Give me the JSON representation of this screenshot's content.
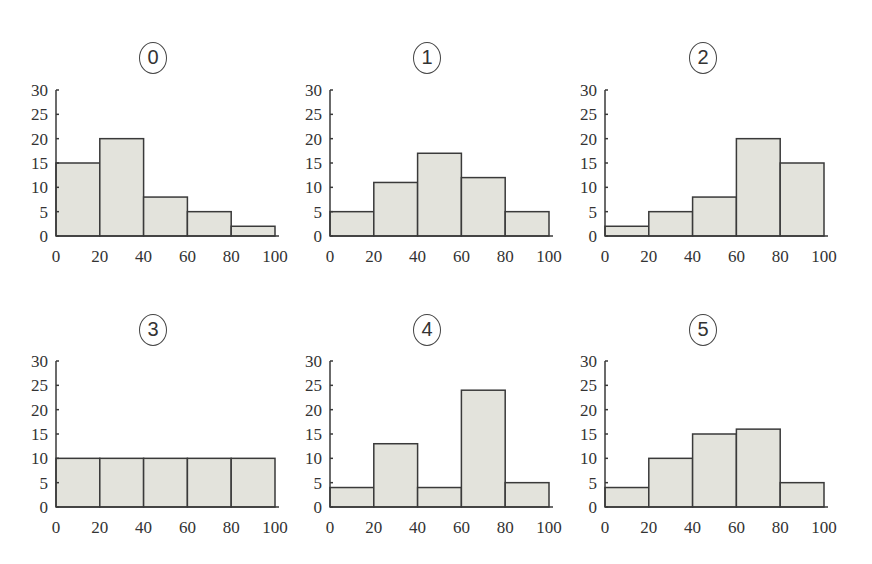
{
  "chart_data": [
    {
      "type": "bar",
      "title": "⓪",
      "label": "0",
      "categories": [
        "0-20",
        "20-40",
        "40-60",
        "60-80",
        "80-100"
      ],
      "bin_edges": [
        0,
        20,
        40,
        60,
        80,
        100
      ],
      "values": [
        15,
        20,
        8,
        5,
        2
      ],
      "xlabel": "",
      "ylabel": "",
      "xticks": [
        0,
        20,
        40,
        60,
        80,
        100
      ],
      "yticks": [
        0,
        5,
        10,
        15,
        20,
        25,
        30
      ],
      "ylim": [
        0,
        30
      ],
      "grid": false
    },
    {
      "type": "bar",
      "title": "①",
      "label": "1",
      "categories": [
        "0-20",
        "20-40",
        "40-60",
        "60-80",
        "80-100"
      ],
      "bin_edges": [
        0,
        20,
        40,
        60,
        80,
        100
      ],
      "values": [
        5,
        11,
        17,
        12,
        5
      ],
      "xlabel": "",
      "ylabel": "",
      "xticks": [
        0,
        20,
        40,
        60,
        80,
        100
      ],
      "yticks": [
        0,
        5,
        10,
        15,
        20,
        25,
        30
      ],
      "ylim": [
        0,
        30
      ],
      "grid": false
    },
    {
      "type": "bar",
      "title": "②",
      "label": "2",
      "categories": [
        "0-20",
        "20-40",
        "40-60",
        "60-80",
        "80-100"
      ],
      "bin_edges": [
        0,
        20,
        40,
        60,
        80,
        100
      ],
      "values": [
        2,
        5,
        8,
        20,
        15
      ],
      "xlabel": "",
      "ylabel": "",
      "xticks": [
        0,
        20,
        40,
        60,
        80,
        100
      ],
      "yticks": [
        0,
        5,
        10,
        15,
        20,
        25,
        30
      ],
      "ylim": [
        0,
        30
      ],
      "grid": false
    },
    {
      "type": "bar",
      "title": "③",
      "label": "3",
      "categories": [
        "0-20",
        "20-40",
        "40-60",
        "60-80",
        "80-100"
      ],
      "bin_edges": [
        0,
        20,
        40,
        60,
        80,
        100
      ],
      "values": [
        10,
        10,
        10,
        10,
        10
      ],
      "xlabel": "",
      "ylabel": "",
      "xticks": [
        0,
        20,
        40,
        60,
        80,
        100
      ],
      "yticks": [
        0,
        5,
        10,
        15,
        20,
        25,
        30
      ],
      "ylim": [
        0,
        30
      ],
      "grid": false
    },
    {
      "type": "bar",
      "title": "④",
      "label": "4",
      "categories": [
        "0-20",
        "20-40",
        "40-60",
        "60-80",
        "80-100"
      ],
      "bin_edges": [
        0,
        20,
        40,
        60,
        80,
        100
      ],
      "values": [
        4,
        13,
        4,
        24,
        5
      ],
      "xlabel": "",
      "ylabel": "",
      "xticks": [
        0,
        20,
        40,
        60,
        80,
        100
      ],
      "yticks": [
        0,
        5,
        10,
        15,
        20,
        25,
        30
      ],
      "ylim": [
        0,
        30
      ],
      "grid": false
    },
    {
      "type": "bar",
      "title": "⑤",
      "label": "5",
      "categories": [
        "0-20",
        "20-40",
        "40-60",
        "60-80",
        "80-100"
      ],
      "bin_edges": [
        0,
        20,
        40,
        60,
        80,
        100
      ],
      "values": [
        4,
        10,
        15,
        16,
        5
      ],
      "xlabel": "",
      "ylabel": "",
      "xticks": [
        0,
        20,
        40,
        60,
        80,
        100
      ],
      "yticks": [
        0,
        5,
        10,
        15,
        20,
        25,
        30
      ],
      "ylim": [
        0,
        30
      ],
      "grid": false
    }
  ],
  "layout": {
    "bar_fill": "#e3e3dc",
    "bar_stroke": "#3a3a3a",
    "panels": [
      {
        "axis_x": 56,
        "baseline_y": 236,
        "title_cx": 153,
        "title_y": 42
      },
      {
        "axis_x": 330,
        "baseline_y": 236,
        "title_cx": 427,
        "title_y": 42
      },
      {
        "axis_x": 605,
        "baseline_y": 236,
        "title_cx": 703,
        "title_y": 42
      },
      {
        "axis_x": 56,
        "baseline_y": 507,
        "title_cx": 153,
        "title_y": 314
      },
      {
        "axis_x": 330,
        "baseline_y": 507,
        "title_cx": 427,
        "title_y": 314
      },
      {
        "axis_x": 605,
        "baseline_y": 507,
        "title_cx": 703,
        "title_y": 314
      }
    ]
  }
}
